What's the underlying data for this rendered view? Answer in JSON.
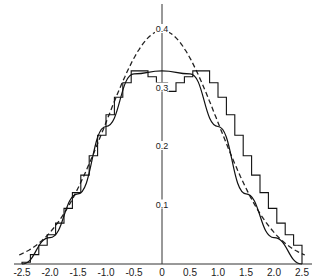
{
  "chart_data": {
    "type": "line",
    "title": "",
    "xlabel": "",
    "ylabel": "",
    "xlim": [
      -2.5,
      2.5
    ],
    "ylim": [
      0,
      0.4
    ],
    "grid": false,
    "legend": null,
    "x_ticks": [
      "-2.5",
      "-2.0",
      "-1.5",
      "-1.0",
      "-0.5",
      "0",
      "0.5",
      "1.0",
      "1.5",
      "2.0",
      "2.5"
    ],
    "x_tick_values": [
      -2.5,
      -2.0,
      -1.5,
      -1.0,
      -0.5,
      0,
      0.5,
      1.0,
      1.5,
      2.0,
      2.5
    ],
    "y_ticks": [
      "0.1",
      "0.2",
      "0.3",
      "0.4"
    ],
    "y_tick_values": [
      0.1,
      0.2,
      0.3,
      0.4
    ],
    "series": [
      {
        "name": "normal-density",
        "style": "dashed",
        "description": "Standard normal density curve, peak 0.4 at x=0",
        "x": [
          -2.5,
          -2.0,
          -1.5,
          -1.0,
          -0.5,
          0,
          0.5,
          1.0,
          1.5,
          2.0,
          2.5
        ],
        "y": [
          0.018,
          0.054,
          0.13,
          0.242,
          0.352,
          0.399,
          0.352,
          0.242,
          0.13,
          0.054,
          0.018
        ]
      },
      {
        "name": "smooth-density",
        "style": "solid",
        "description": "Flat-topped smooth density curve",
        "x": [
          -2.5,
          -2.0,
          -1.5,
          -1.0,
          -0.5,
          0,
          0.5,
          1.0,
          1.5,
          2.0,
          2.5
        ],
        "y": [
          0.0,
          0.045,
          0.12,
          0.235,
          0.325,
          0.33,
          0.325,
          0.235,
          0.12,
          0.045,
          0.0
        ]
      },
      {
        "name": "step-histogram",
        "style": "step",
        "description": "Staircase approximation, with a dip near x=0",
        "x": [
          -2.5,
          -2.35,
          -2.2,
          -2.05,
          -1.9,
          -1.75,
          -1.6,
          -1.45,
          -1.3,
          -1.15,
          -1.0,
          -0.85,
          -0.7,
          -0.55,
          -0.4,
          -0.25,
          -0.1,
          0.1,
          0.25,
          0.4,
          0.55,
          0.7,
          0.85,
          1.0,
          1.15,
          1.3,
          1.45,
          1.6,
          1.75,
          1.9,
          2.05,
          2.2,
          2.35,
          2.5
        ],
        "y": [
          0.003,
          0.016,
          0.032,
          0.05,
          0.07,
          0.095,
          0.122,
          0.152,
          0.185,
          0.22,
          0.255,
          0.285,
          0.31,
          0.33,
          0.33,
          0.32,
          0.31,
          0.295,
          0.31,
          0.32,
          0.33,
          0.33,
          0.31,
          0.285,
          0.255,
          0.22,
          0.185,
          0.152,
          0.122,
          0.095,
          0.07,
          0.05,
          0.032,
          0.016
        ]
      }
    ]
  }
}
